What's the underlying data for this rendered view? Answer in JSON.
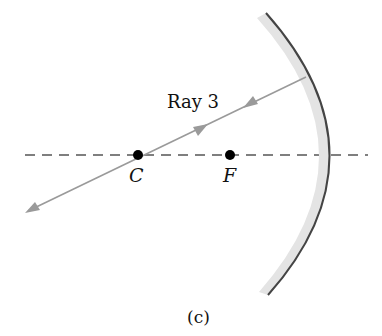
{
  "diagram": {
    "type": "concave-mirror-ray-diagram",
    "ray_label": "Ray 3",
    "center_label": "C",
    "focus_label": "F",
    "caption": "(c)",
    "colors": {
      "ray": "#9a9a9a",
      "axis": "#555555",
      "mirror_edge": "#444444",
      "mirror_back": "#e2e2e2",
      "points": "#000000"
    }
  }
}
